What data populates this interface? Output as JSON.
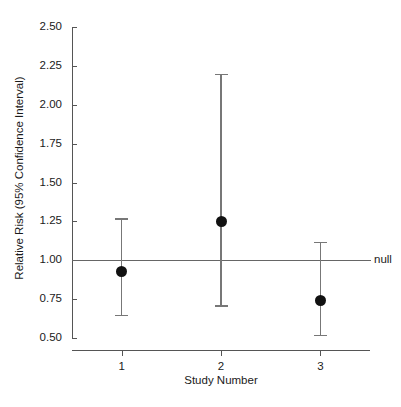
{
  "chart_data": {
    "type": "scatter",
    "title": "",
    "xlabel": "Study Number",
    "ylabel": "Relative Risk (95% Confidence Interval)",
    "xlim": [
      0.5,
      3.5
    ],
    "ylim": [
      0.5,
      2.5
    ],
    "grid": false,
    "legend": null,
    "x": [
      1,
      2,
      3
    ],
    "categories": [
      "1",
      "2",
      "3"
    ],
    "xticklabels": [
      "1",
      "2",
      "3"
    ],
    "yticklabels": [
      "0.50",
      "0.75",
      "1.00",
      "1.25",
      "1.50",
      "1.75",
      "2.00",
      "2.25",
      "2.50"
    ],
    "ytickvalues": [
      0.5,
      0.75,
      1.0,
      1.25,
      1.5,
      1.75,
      2.0,
      2.25,
      2.5
    ],
    "values": [
      0.93,
      1.25,
      0.74
    ],
    "ci_lower": [
      0.65,
      0.71,
      0.52
    ],
    "ci_upper": [
      1.27,
      2.2,
      1.12
    ],
    "points": [
      {
        "study": "1",
        "x": 1,
        "estimate": 0.93,
        "ci_low": 0.65,
        "ci_high": 1.27
      },
      {
        "study": "2",
        "x": 2,
        "estimate": 1.25,
        "ci_low": 0.71,
        "ci_high": 2.2
      },
      {
        "study": "3",
        "x": 3,
        "estimate": 0.74,
        "ci_low": 0.52,
        "ci_high": 1.12
      }
    ],
    "annotations": [
      {
        "name": "null-reference-line",
        "label": "null",
        "y": 1.0
      }
    ],
    "colors": {
      "point": "#111111",
      "error_bar": "#777777",
      "axis": "#555555",
      "null_line": "#666666",
      "background": "#ffffff",
      "text": "#1a1a1a"
    }
  }
}
